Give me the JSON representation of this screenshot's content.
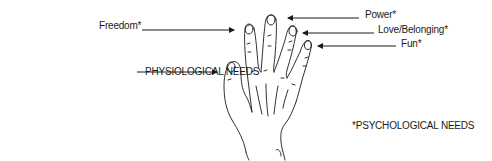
{
  "diagram": {
    "type": "labeled-illustration",
    "labels": {
      "freedom": "Freedom*",
      "power": "Power*",
      "love_belonging": "Love/Belonging*",
      "fun": "Fun*",
      "physiological": "PHYSIOLOGICAL NEEDS"
    },
    "footnote": "*PSYCHOLOGICAL NEEDS",
    "mapping": [
      {
        "label": "Freedom*",
        "finger": "index"
      },
      {
        "label": "Power*",
        "finger": "middle"
      },
      {
        "label": "Love/Belonging*",
        "finger": "ring"
      },
      {
        "label": "Fun*",
        "finger": "little"
      },
      {
        "label": "PHYSIOLOGICAL NEEDS",
        "finger": "thumb"
      }
    ],
    "colors": {
      "line": "#1a1a1a",
      "background": "#ffffff"
    }
  }
}
